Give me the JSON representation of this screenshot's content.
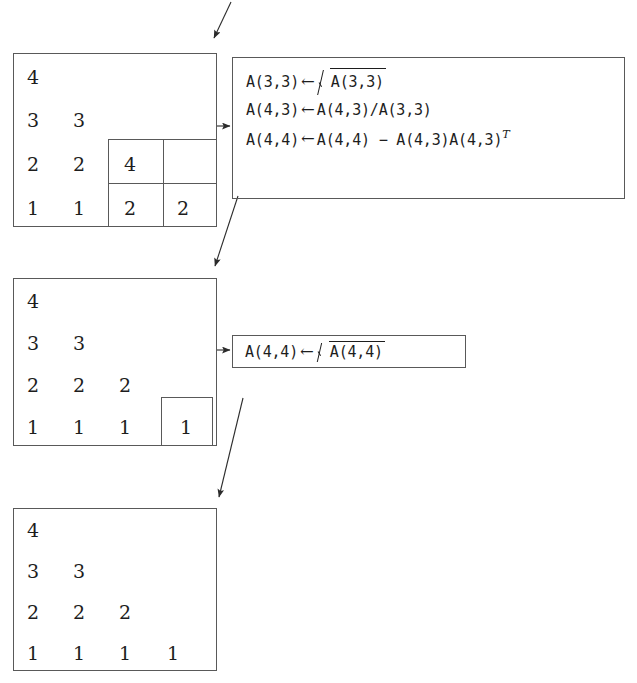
{
  "figure": {
    "stroke_color": "#595959",
    "text_color": "#1d1d1d",
    "background": "#ffffff"
  },
  "matrices": [
    {
      "id": "matrix-1",
      "rows": [
        [
          "4"
        ],
        [
          "3",
          "3"
        ],
        [
          "2",
          "2",
          "4",
          ""
        ],
        [
          "1",
          "1",
          "2",
          "2"
        ]
      ],
      "highlight": {
        "label": "2x2-trailing-block",
        "cells": [
          [
            "4",
            ""
          ],
          [
            "2",
            "2"
          ]
        ]
      }
    },
    {
      "id": "matrix-2",
      "rows": [
        [
          "4"
        ],
        [
          "3",
          "3"
        ],
        [
          "2",
          "2",
          "2"
        ],
        [
          "1",
          "1",
          "1",
          "1"
        ]
      ],
      "highlight": {
        "label": "1x1-trailing-block",
        "cells": [
          [
            "1"
          ]
        ]
      }
    },
    {
      "id": "matrix-3",
      "rows": [
        [
          "4"
        ],
        [
          "3",
          "3"
        ],
        [
          "2",
          "2",
          "2"
        ],
        [
          "1",
          "1",
          "1",
          "1"
        ]
      ],
      "highlight": null
    }
  ],
  "formula_boxes": [
    {
      "id": "formula-box-1",
      "lines": [
        {
          "lhs": "A(3,3)",
          "arrow": "←",
          "rhs_prefix": "",
          "sqrt": true,
          "radicand": "A(3,3)",
          "rhs_suffix": ""
        },
        {
          "lhs": "A(4,3)",
          "arrow": "←",
          "rhs_prefix": "A(4,3)/A(3,3)",
          "sqrt": false,
          "radicand": "",
          "rhs_suffix": ""
        },
        {
          "lhs": "A(4,4)",
          "arrow": "←",
          "rhs_prefix": "A(4,4) − A(4,3)A(4,3)",
          "sqrt": false,
          "radicand": "",
          "rhs_suffix": "T"
        }
      ]
    },
    {
      "id": "formula-box-2",
      "lines": [
        {
          "lhs": "A(4,4)",
          "arrow": "←",
          "rhs_prefix": "",
          "sqrt": true,
          "radicand": "A(4,4)",
          "rhs_suffix": ""
        }
      ]
    }
  ],
  "arrows": [
    {
      "id": "arrow-entry-top",
      "kind": "diagonal",
      "from": "above",
      "to": "matrix-1"
    },
    {
      "id": "arrow-m1-to-f1",
      "kind": "horizontal",
      "from": "matrix-1",
      "to": "formula-box-1"
    },
    {
      "id": "arrow-f1-to-m2",
      "kind": "diagonal",
      "from": "formula-box-1",
      "to": "matrix-2"
    },
    {
      "id": "arrow-m2-to-f2",
      "kind": "horizontal",
      "from": "matrix-2",
      "to": "formula-box-2"
    },
    {
      "id": "arrow-f2-to-m3",
      "kind": "diagonal",
      "from": "formula-box-2",
      "to": "matrix-3"
    }
  ]
}
